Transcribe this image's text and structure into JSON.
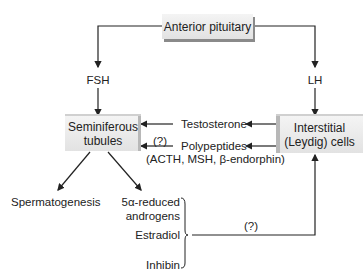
{
  "nodes": {
    "anterior_pituitary": "Anterior pituitary",
    "seminiferous_tubules_1": "Seminiferous",
    "seminiferous_tubules_2": "tubules",
    "interstitial_cells_1": "Interstitial",
    "interstitial_cells_2": "(Leydig) cells"
  },
  "hormones": {
    "fsh": "FSH",
    "lh": "LH",
    "testosterone": "Testosterone",
    "polypeptides": "Polypeptides",
    "polypeptides_detail": "(ACTH, MSH, β-endorphin)",
    "uncertain_1": "(?)",
    "uncertain_2": "(?)"
  },
  "outputs": {
    "spermatogenesis": "Spermatogenesis",
    "androgens_1": "5α-reduced",
    "androgens_2": "androgens",
    "estradiol": "Estradiol",
    "inhibin": "Inhibin"
  },
  "colors": {
    "line": "#222222",
    "box_fill": "#ebebeb",
    "box_shadow": "#8a8a8a"
  }
}
